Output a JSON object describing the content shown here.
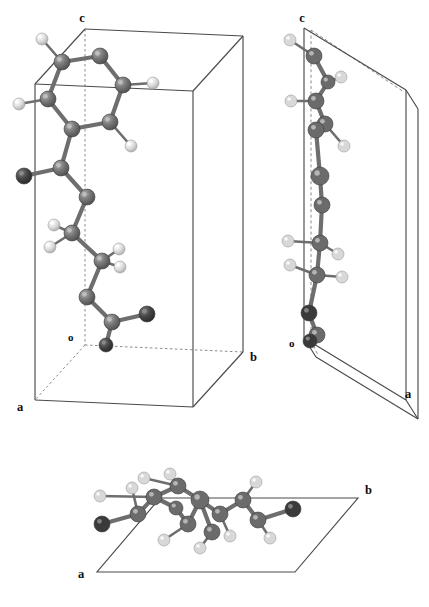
{
  "figure": {
    "kind": "crystal-structure-projection-figure",
    "background_color": "#ffffff",
    "panel_count": 3
  },
  "palette": {
    "cell_edge_solid": "#4a4a4a",
    "cell_edge_dashed": "#7d7d7d",
    "bond_color": "#6e6e6e",
    "carbon_color": "#6b6b6b",
    "carbon_highlight": "#a9a9a9",
    "oxygen_color": "#3a3a3a",
    "oxygen_highlight": "#7a7a7a",
    "hydrogen_color": "#d8d8d8",
    "hydrogen_highlight": "#ffffff",
    "label_color": "#0d0d0d"
  },
  "panels": [
    {
      "id": "panel-ac",
      "name": "left-projection",
      "labels": [
        {
          "text": "c",
          "name": "axis-label-c",
          "x": 88,
          "y": 18
        },
        {
          "text": "o",
          "name": "origin-label-o",
          "x": 73,
          "y": 337
        },
        {
          "text": "a",
          "name": "axis-label-a",
          "x": 22,
          "y": 406
        },
        {
          "text": "b",
          "name": "axis-label-b",
          "x": 254,
          "y": 356
        }
      ]
    },
    {
      "id": "panel-bc",
      "name": "right-projection",
      "labels": [
        {
          "text": "c",
          "name": "axis-label-c",
          "x": 47,
          "y": 18
        },
        {
          "text": "o",
          "name": "origin-label-o",
          "x": 35,
          "y": 343
        },
        {
          "text": "a",
          "name": "axis-label-a",
          "x": 151,
          "y": 394
        }
      ]
    },
    {
      "id": "panel-ab",
      "name": "bottom-projection",
      "labels": [
        {
          "text": "b",
          "name": "axis-label-b",
          "x": 304,
          "y": 58
        },
        {
          "text": "a",
          "name": "axis-label-a",
          "x": 22,
          "y": 142
        }
      ]
    }
  ],
  "atom_legend": [
    {
      "element": "C",
      "name": "carbon-atom",
      "color": "#6b6b6b",
      "radius": 7.5
    },
    {
      "element": "O",
      "name": "oxygen-atom",
      "color": "#3a3a3a",
      "radius": 7.5
    },
    {
      "element": "H",
      "name": "hydrogen-atom",
      "color": "#d8d8d8",
      "radius": 5.5
    }
  ],
  "structure_ac": {
    "atoms": [
      {
        "id": "C1",
        "el": "C",
        "x": 100,
        "y": 56,
        "r": 8
      },
      {
        "id": "C2",
        "el": "C",
        "x": 62,
        "y": 62,
        "r": 8
      },
      {
        "id": "C3",
        "el": "C",
        "x": 48,
        "y": 99,
        "r": 8
      },
      {
        "id": "C4",
        "el": "C",
        "x": 72,
        "y": 129,
        "r": 8
      },
      {
        "id": "C5",
        "el": "C",
        "x": 110,
        "y": 122,
        "r": 8
      },
      {
        "id": "C6",
        "el": "C",
        "x": 123,
        "y": 85,
        "r": 8
      },
      {
        "id": "H1",
        "el": "H",
        "x": 42,
        "y": 39,
        "r": 6
      },
      {
        "id": "H2",
        "el": "H",
        "x": 19,
        "y": 104,
        "r": 6
      },
      {
        "id": "H3",
        "el": "H",
        "x": 131,
        "y": 146,
        "r": 6
      },
      {
        "id": "H4",
        "el": "H",
        "x": 153,
        "y": 83,
        "r": 6
      },
      {
        "id": "C7",
        "el": "C",
        "x": 61,
        "y": 168,
        "r": 8
      },
      {
        "id": "O1",
        "el": "O",
        "x": 24,
        "y": 176,
        "r": 8
      },
      {
        "id": "C8",
        "el": "C",
        "x": 87,
        "y": 197,
        "r": 8
      },
      {
        "id": "C9",
        "el": "C",
        "x": 72,
        "y": 233,
        "r": 8
      },
      {
        "id": "H5",
        "el": "H",
        "x": 54,
        "y": 225,
        "r": 6
      },
      {
        "id": "H6",
        "el": "H",
        "x": 50,
        "y": 247,
        "r": 6
      },
      {
        "id": "C10",
        "el": "C",
        "x": 102,
        "y": 261,
        "r": 8
      },
      {
        "id": "H7",
        "el": "H",
        "x": 119,
        "y": 249,
        "r": 6
      },
      {
        "id": "H8",
        "el": "H",
        "x": 120,
        "y": 267,
        "r": 6
      },
      {
        "id": "C11",
        "el": "C",
        "x": 87,
        "y": 297,
        "r": 8
      },
      {
        "id": "C12",
        "el": "C",
        "x": 112,
        "y": 322,
        "r": 8
      },
      {
        "id": "O2",
        "el": "O",
        "x": 147,
        "y": 314,
        "r": 8
      },
      {
        "id": "O3",
        "el": "O",
        "x": 106,
        "y": 345,
        "r": 7
      }
    ],
    "bonds": [
      [
        "C1",
        "C2"
      ],
      [
        "C2",
        "C3"
      ],
      [
        "C3",
        "C4"
      ],
      [
        "C4",
        "C5"
      ],
      [
        "C5",
        "C6"
      ],
      [
        "C6",
        "C1"
      ],
      [
        "C2",
        "H1"
      ],
      [
        "C3",
        "H2"
      ],
      [
        "C5",
        "H3"
      ],
      [
        "C6",
        "H4"
      ],
      [
        "C4",
        "C7"
      ],
      [
        "C7",
        "O1"
      ],
      [
        "C7",
        "C8"
      ],
      [
        "C8",
        "C9"
      ],
      [
        "C9",
        "H5"
      ],
      [
        "C9",
        "H6"
      ],
      [
        "C9",
        "C10"
      ],
      [
        "C10",
        "H7"
      ],
      [
        "C10",
        "H8"
      ],
      [
        "C10",
        "C11"
      ],
      [
        "C11",
        "C12"
      ],
      [
        "C12",
        "O2"
      ],
      [
        "C12",
        "O3"
      ]
    ]
  },
  "structure_bc": {
    "atoms": [
      {
        "id": "C1",
        "el": "C",
        "x": 56,
        "y": 56,
        "r": 8
      },
      {
        "id": "H1",
        "el": "H",
        "x": 32,
        "y": 40,
        "r": 6
      },
      {
        "id": "C2",
        "el": "C",
        "x": 70,
        "y": 82,
        "r": 7
      },
      {
        "id": "H2",
        "el": "H",
        "x": 83,
        "y": 77,
        "r": 6
      },
      {
        "id": "C3",
        "el": "C",
        "x": 58,
        "y": 101,
        "r": 8
      },
      {
        "id": "H3",
        "el": "H",
        "x": 33,
        "y": 101,
        "r": 6
      },
      {
        "id": "C4",
        "el": "C",
        "x": 67,
        "y": 124,
        "r": 8
      },
      {
        "id": "C5",
        "el": "C",
        "x": 58,
        "y": 130,
        "r": 8
      },
      {
        "id": "H4",
        "el": "H",
        "x": 86,
        "y": 146,
        "r": 6
      },
      {
        "id": "C6",
        "el": "C",
        "x": 62,
        "y": 176,
        "r": 9
      },
      {
        "id": "C7",
        "el": "C",
        "x": 64,
        "y": 205,
        "r": 8
      },
      {
        "id": "C8",
        "el": "C",
        "x": 62,
        "y": 243,
        "r": 8
      },
      {
        "id": "H5",
        "el": "H",
        "x": 30,
        "y": 241,
        "r": 6
      },
      {
        "id": "H6",
        "el": "H",
        "x": 80,
        "y": 254,
        "r": 6
      },
      {
        "id": "C9",
        "el": "C",
        "x": 59,
        "y": 275,
        "r": 8
      },
      {
        "id": "H7",
        "el": "H",
        "x": 32,
        "y": 265,
        "r": 6
      },
      {
        "id": "H8",
        "el": "H",
        "x": 84,
        "y": 277,
        "r": 6
      },
      {
        "id": "O1",
        "el": "O",
        "x": 51,
        "y": 313,
        "r": 8
      },
      {
        "id": "C10",
        "el": "C",
        "x": 59,
        "y": 335,
        "r": 8
      },
      {
        "id": "O2",
        "el": "O",
        "x": 52,
        "y": 341,
        "r": 7
      }
    ],
    "bonds": [
      [
        "C1",
        "H1"
      ],
      [
        "C1",
        "C2"
      ],
      [
        "C2",
        "H2"
      ],
      [
        "C2",
        "C3"
      ],
      [
        "C3",
        "H3"
      ],
      [
        "C3",
        "C4"
      ],
      [
        "C4",
        "C5"
      ],
      [
        "C4",
        "H4"
      ],
      [
        "C5",
        "C6"
      ],
      [
        "C6",
        "C7"
      ],
      [
        "C7",
        "C8"
      ],
      [
        "C8",
        "H5"
      ],
      [
        "C8",
        "H6"
      ],
      [
        "C8",
        "C9"
      ],
      [
        "C9",
        "H7"
      ],
      [
        "C9",
        "H8"
      ],
      [
        "C9",
        "O1"
      ],
      [
        "O1",
        "C10"
      ],
      [
        "C10",
        "O2"
      ]
    ]
  },
  "structure_ab": {
    "atoms": [
      {
        "id": "O1",
        "el": "O",
        "x": 22,
        "y": 72,
        "r": 8
      },
      {
        "id": "C1",
        "el": "C",
        "x": 58,
        "y": 62,
        "r": 8
      },
      {
        "id": "H1",
        "el": "H",
        "x": 20,
        "y": 44,
        "r": 6
      },
      {
        "id": "C2",
        "el": "C",
        "x": 74,
        "y": 45,
        "r": 8
      },
      {
        "id": "H2",
        "el": "H",
        "x": 52,
        "y": 36,
        "r": 6
      },
      {
        "id": "C3",
        "el": "C",
        "x": 98,
        "y": 34,
        "r": 8
      },
      {
        "id": "H3",
        "el": "H",
        "x": 90,
        "y": 22,
        "r": 6
      },
      {
        "id": "C4",
        "el": "C",
        "x": 120,
        "y": 48,
        "r": 9
      },
      {
        "id": "C5",
        "el": "C",
        "x": 108,
        "y": 72,
        "r": 8
      },
      {
        "id": "H4",
        "el": "H",
        "x": 84,
        "y": 88,
        "r": 6
      },
      {
        "id": "C6",
        "el": "C",
        "x": 140,
        "y": 62,
        "r": 8
      },
      {
        "id": "H5",
        "el": "H",
        "x": 150,
        "y": 84,
        "r": 6
      },
      {
        "id": "C7",
        "el": "C",
        "x": 163,
        "y": 48,
        "r": 8
      },
      {
        "id": "H6",
        "el": "H",
        "x": 176,
        "y": 30,
        "r": 6
      },
      {
        "id": "C8",
        "el": "C",
        "x": 178,
        "y": 68,
        "r": 8
      },
      {
        "id": "H7",
        "el": "H",
        "x": 190,
        "y": 86,
        "r": 6
      },
      {
        "id": "O2",
        "el": "O",
        "x": 213,
        "y": 57,
        "r": 8
      },
      {
        "id": "C9",
        "el": "C",
        "x": 132,
        "y": 80,
        "r": 8
      },
      {
        "id": "H8",
        "el": "H",
        "x": 120,
        "y": 96,
        "r": 6
      },
      {
        "id": "C10",
        "el": "C",
        "x": 96,
        "y": 56,
        "r": 7
      },
      {
        "id": "H9",
        "el": "H",
        "x": 64,
        "y": 26,
        "r": 6
      }
    ],
    "bonds": [
      [
        "O1",
        "C1"
      ],
      [
        "C1",
        "C2"
      ],
      [
        "C1",
        "H2"
      ],
      [
        "C2",
        "H1"
      ],
      [
        "C2",
        "C3"
      ],
      [
        "C3",
        "H3"
      ],
      [
        "C3",
        "C4"
      ],
      [
        "C4",
        "C5"
      ],
      [
        "C4",
        "C6"
      ],
      [
        "C5",
        "H4"
      ],
      [
        "C6",
        "H5"
      ],
      [
        "C6",
        "C7"
      ],
      [
        "C7",
        "H6"
      ],
      [
        "C7",
        "C8"
      ],
      [
        "C8",
        "H7"
      ],
      [
        "C8",
        "O2"
      ],
      [
        "C9",
        "H8"
      ],
      [
        "C9",
        "C4"
      ],
      [
        "C10",
        "C2"
      ],
      [
        "C10",
        "C5"
      ],
      [
        "C3",
        "H9"
      ]
    ]
  }
}
